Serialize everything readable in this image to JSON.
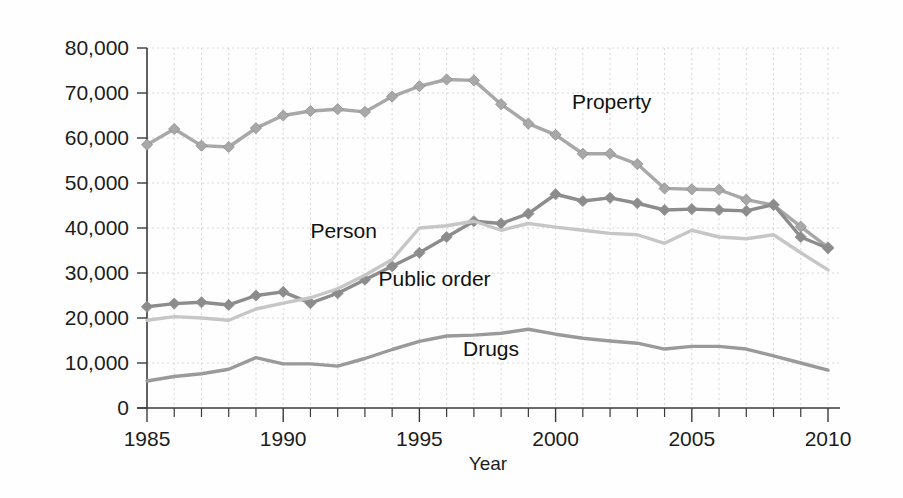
{
  "chart_data": {
    "type": "line",
    "title": "",
    "xlabel": "Year",
    "ylabel": "",
    "xlim": [
      1985,
      2010
    ],
    "ylim": [
      0,
      80000
    ],
    "grid": true,
    "legend_position": "inline-annotations",
    "x": [
      1985,
      1986,
      1987,
      1988,
      1989,
      1990,
      1991,
      1992,
      1993,
      1994,
      1995,
      1996,
      1997,
      1998,
      1999,
      2000,
      2001,
      2002,
      2003,
      2004,
      2005,
      2006,
      2007,
      2008,
      2009,
      2010
    ],
    "x_tick_labels": [
      "1985",
      "1990",
      "1995",
      "2000",
      "2005",
      "2010"
    ],
    "x_tick_values": [
      1985,
      1990,
      1995,
      2000,
      2005,
      2010
    ],
    "y_tick_labels": [
      "0",
      "10,000",
      "20,000",
      "30,000",
      "40,000",
      "50,000",
      "60,000",
      "70,000",
      "80,000"
    ],
    "y_tick_values": [
      0,
      10000,
      20000,
      30000,
      40000,
      50000,
      60000,
      70000,
      80000
    ],
    "series": [
      {
        "name": "Property",
        "label": "Property",
        "color": "#a8a8a8",
        "marker": "diamond",
        "label_x": 2000.6,
        "label_y": 66500,
        "values": [
          58500,
          62000,
          58300,
          58000,
          62200,
          65000,
          66000,
          66400,
          65800,
          69200,
          71500,
          73000,
          72800,
          67500,
          63200,
          60700,
          56500,
          56500,
          54200,
          48800,
          48600,
          48500,
          46300,
          45100,
          40300,
          35700
        ]
      },
      {
        "name": "Public order",
        "label": "Public order",
        "color": "#8c8c8c",
        "marker": "diamond",
        "label_x": 1993.5,
        "label_y": 27200,
        "values": [
          22500,
          23200,
          23500,
          22900,
          25000,
          25800,
          23300,
          25500,
          28500,
          31500,
          34500,
          38000,
          41500,
          41000,
          43200,
          47500,
          46000,
          46700,
          45500,
          44000,
          44200,
          44000,
          43800,
          45200,
          38000,
          35500
        ]
      },
      {
        "name": "Person",
        "label": "Person",
        "color": "#c6c6c6",
        "marker": "none",
        "label_x": 1991.0,
        "label_y": 37800,
        "values": [
          19500,
          20300,
          20000,
          19500,
          22000,
          23300,
          24500,
          26500,
          29500,
          33000,
          40000,
          40500,
          41500,
          39500,
          41000,
          40200,
          39500,
          38800,
          38500,
          36600,
          39500,
          38000,
          37600,
          38500,
          34500,
          30700
        ]
      },
      {
        "name": "Drugs",
        "label": "Drugs",
        "color": "#9a9a9a",
        "marker": "none",
        "label_x": 1996.6,
        "label_y": 11500,
        "values": [
          6000,
          7000,
          7600,
          8600,
          11200,
          9800,
          9800,
          9300,
          11000,
          13000,
          14800,
          16000,
          16200,
          16600,
          17500,
          16400,
          15500,
          14900,
          14400,
          13100,
          13700,
          13700,
          13100,
          11600,
          10000,
          8400
        ]
      }
    ]
  },
  "axis": {
    "x_axis_title": "Year"
  }
}
